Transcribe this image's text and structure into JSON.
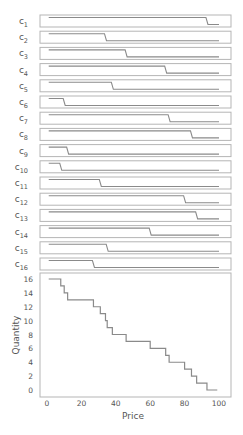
{
  "chart_data": {
    "type": "line",
    "subtype": "step",
    "title": "",
    "xlabel": "Price",
    "ylabel": "Quantity",
    "xlim": [
      0,
      100
    ],
    "ylim": [
      0,
      16
    ],
    "xticks": [
      0,
      20,
      40,
      60,
      80,
      100
    ],
    "yticks": [
      0,
      2,
      4,
      6,
      8,
      10,
      12,
      14,
      16
    ],
    "grid": false,
    "panels": [
      {
        "label": "c",
        "sub": "1",
        "step_price": 93
      },
      {
        "label": "c",
        "sub": "2",
        "step_price": 34
      },
      {
        "label": "c",
        "sub": "3",
        "step_price": 46
      },
      {
        "label": "c",
        "sub": "4",
        "step_price": 69
      },
      {
        "label": "c",
        "sub": "5",
        "step_price": 38
      },
      {
        "label": "c",
        "sub": "6",
        "step_price": 10
      },
      {
        "label": "c",
        "sub": "7",
        "step_price": 71
      },
      {
        "label": "c",
        "sub": "8",
        "step_price": 84
      },
      {
        "label": "c",
        "sub": "9",
        "step_price": 12
      },
      {
        "label": "c",
        "sub": "10",
        "step_price": 8
      },
      {
        "label": "c",
        "sub": "11",
        "step_price": 31
      },
      {
        "label": "c",
        "sub": "12",
        "step_price": 80
      },
      {
        "label": "c",
        "sub": "13",
        "step_price": 87
      },
      {
        "label": "c",
        "sub": "14",
        "step_price": 60
      },
      {
        "label": "c",
        "sub": "15",
        "step_price": 35
      },
      {
        "label": "c",
        "sub": "16",
        "step_price": 27
      }
    ],
    "series": [
      {
        "name": "Aggregate demand",
        "x": [
          1,
          8,
          10,
          12,
          27,
          31,
          34,
          35,
          38,
          46,
          60,
          69,
          71,
          80,
          84,
          87,
          93,
          99
        ],
        "y": [
          16,
          15,
          14,
          13,
          12,
          11,
          10,
          9,
          8,
          7,
          6,
          5,
          4,
          3,
          2,
          1,
          0,
          0
        ]
      }
    ],
    "colors": {
      "line": "#8a8a8a",
      "frame": "#b5b5b5",
      "text": "#555555"
    }
  }
}
